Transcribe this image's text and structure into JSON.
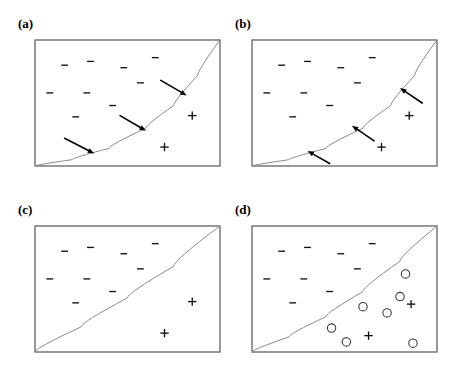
{
  "figure": {
    "background_color": "#ffffff",
    "width": 459,
    "height": 376,
    "frame_color": "#555555",
    "boundary_color": "#8a8a8a",
    "mark_color": "#111111",
    "circle_color": "#3b3b3b",
    "arrow_color": "#000000"
  },
  "chart_data": {
    "type": "scatter",
    "xlabel": "",
    "ylabel": "",
    "xlim": [
      0,
      100
    ],
    "ylim": [
      0,
      100
    ],
    "grid": false,
    "legend": "none",
    "panel_count": 4,
    "panels": [
      {
        "id": "a",
        "label": "(a)",
        "frame_px": {
          "x": 35,
          "y": 40,
          "width": 185,
          "height": 126
        },
        "boundary": {
          "description": "convex decision boundary rising from bottom-left corner to top-right corner",
          "type": "curve",
          "points": [
            [
              0,
              0
            ],
            [
              20,
              5
            ],
            [
              40,
              14
            ],
            [
              60,
              30
            ],
            [
              75,
              48
            ],
            [
              88,
              72
            ],
            [
              100,
              100
            ]
          ]
        },
        "negatives": [
          [
            16,
            80
          ],
          [
            30,
            83
          ],
          [
            48,
            78
          ],
          [
            65,
            86
          ],
          [
            8,
            58
          ],
          [
            28,
            58
          ],
          [
            57,
            66
          ],
          [
            42,
            48
          ],
          [
            22,
            39
          ]
        ],
        "positives": [
          [
            85,
            40
          ],
          [
            70,
            15
          ]
        ],
        "circles": [],
        "arrows": [
          {
            "from": [
              68,
              68
            ],
            "to": [
              82,
              56
            ]
          },
          {
            "from": [
              46,
              40
            ],
            "to": [
              60,
              28
            ]
          },
          {
            "from": [
              16,
              22
            ],
            "to": [
              32,
              10
            ]
          }
        ]
      },
      {
        "id": "b",
        "label": "(b)",
        "frame_px": {
          "x": 252,
          "y": 40,
          "width": 185,
          "height": 126
        },
        "boundary": {
          "description": "convex decision boundary rising from bottom-left corner to top-right corner",
          "type": "curve",
          "points": [
            [
              0,
              0
            ],
            [
              20,
              5
            ],
            [
              40,
              14
            ],
            [
              60,
              30
            ],
            [
              75,
              48
            ],
            [
              88,
              72
            ],
            [
              100,
              100
            ]
          ]
        },
        "negatives": [
          [
            16,
            80
          ],
          [
            30,
            83
          ],
          [
            48,
            78
          ],
          [
            65,
            86
          ],
          [
            8,
            58
          ],
          [
            28,
            58
          ],
          [
            57,
            66
          ],
          [
            42,
            48
          ],
          [
            22,
            39
          ]
        ],
        "positives": [
          [
            85,
            40
          ],
          [
            70,
            15
          ]
        ],
        "circles": [],
        "arrows": [
          {
            "from": [
              92,
              50
            ],
            "to": [
              80,
              62
            ]
          },
          {
            "from": [
              66,
              20
            ],
            "to": [
              54,
              32
            ]
          },
          {
            "from": [
              42,
              2
            ],
            "to": [
              30,
              12
            ]
          }
        ]
      },
      {
        "id": "c",
        "label": "(c)",
        "frame_px": {
          "x": 35,
          "y": 226,
          "width": 185,
          "height": 126
        },
        "boundary": {
          "description": "nearly straight decision boundary from bottom-left corner to top-right corner with slight bulge",
          "type": "curve",
          "points": [
            [
              0,
              0
            ],
            [
              25,
              20
            ],
            [
              50,
              43
            ],
            [
              75,
              68
            ],
            [
              100,
              100
            ]
          ]
        },
        "negatives": [
          [
            16,
            80
          ],
          [
            30,
            83
          ],
          [
            48,
            78
          ],
          [
            65,
            86
          ],
          [
            8,
            58
          ],
          [
            28,
            58
          ],
          [
            57,
            66
          ],
          [
            42,
            48
          ],
          [
            22,
            39
          ]
        ],
        "positives": [
          [
            85,
            40
          ],
          [
            70,
            15
          ]
        ],
        "circles": [],
        "arrows": []
      },
      {
        "id": "d",
        "label": "(d)",
        "frame_px": {
          "x": 252,
          "y": 226,
          "width": 185,
          "height": 126
        },
        "boundary": {
          "description": "convex decision boundary from bottom-left corner to top-right corner",
          "type": "curve",
          "points": [
            [
              0,
              0
            ],
            [
              20,
              12
            ],
            [
              40,
              28
            ],
            [
              60,
              48
            ],
            [
              80,
              72
            ],
            [
              100,
              100
            ]
          ]
        },
        "negatives": [
          [
            16,
            80
          ],
          [
            30,
            83
          ],
          [
            48,
            78
          ],
          [
            65,
            86
          ],
          [
            8,
            58
          ],
          [
            28,
            58
          ],
          [
            57,
            66
          ],
          [
            42,
            48
          ],
          [
            22,
            39
          ]
        ],
        "positives": [
          [
            86,
            38
          ],
          [
            63,
            13
          ]
        ],
        "circles": [
          [
            83,
            62
          ],
          [
            80,
            44
          ],
          [
            60,
            36
          ],
          [
            73,
            31
          ],
          [
            43,
            19
          ],
          [
            51,
            8
          ],
          [
            87,
            7
          ]
        ],
        "arrows": []
      }
    ],
    "marker_legend": {
      "minus": "negative labeled instance",
      "plus": "positive labeled instance",
      "circle": "unlabeled / queried instance",
      "arrow": "query direction toward decision boundary"
    }
  }
}
